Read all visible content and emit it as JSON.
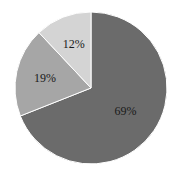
{
  "chart_data": {
    "type": "pie",
    "title": "",
    "categories": [
      "A",
      "B",
      "C"
    ],
    "values": [
      69,
      19,
      12
    ],
    "labels": [
      "69%",
      "19%",
      "12%"
    ],
    "colors": [
      "#6b6b6b",
      "#a6a6a6",
      "#d4d4d4"
    ],
    "start_angle_deg": 0,
    "direction": "clockwise",
    "legend": "none"
  }
}
